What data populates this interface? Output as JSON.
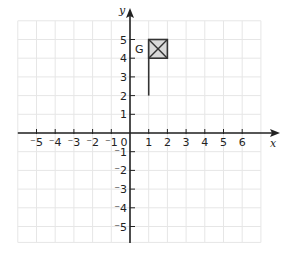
{
  "diagram": {
    "type": "coordinate-grid",
    "x_axis": {
      "label": "x",
      "ticks": [
        "-5",
        "-4",
        "-3",
        "-2",
        "-1",
        "0",
        "1",
        "2",
        "3",
        "4",
        "5",
        "6"
      ]
    },
    "y_axis": {
      "label": "y",
      "ticks": [
        "5",
        "4",
        "3",
        "2",
        "1",
        "-1",
        "-2",
        "-3",
        "-4",
        "-5"
      ]
    },
    "shape": {
      "name": "flag",
      "label": "G",
      "pole": {
        "from": [
          1,
          2
        ],
        "to": [
          1,
          5
        ]
      },
      "box": {
        "x": [
          1,
          2
        ],
        "y": [
          4,
          5
        ],
        "fill": "#d9d9d9",
        "marked_with_x": true
      }
    },
    "colors": {
      "grid": "#e6e6e6",
      "axis": "#222222",
      "flag_fill": "#d9d9d9"
    }
  }
}
